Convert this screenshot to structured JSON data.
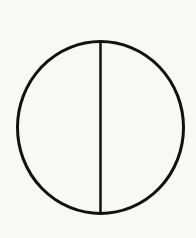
{
  "figure": {
    "background_color": "#f8f8f6",
    "stroke_color": "#111111",
    "stroke_width": 3,
    "circle": {
      "cx": 100.5,
      "cy": 127.5,
      "rx": 83,
      "ry": 86
    },
    "diameter": {
      "x1": 100.5,
      "y1": 41.5,
      "x2": 100.5,
      "y2": 213.5,
      "stroke_width": 2.5
    }
  }
}
